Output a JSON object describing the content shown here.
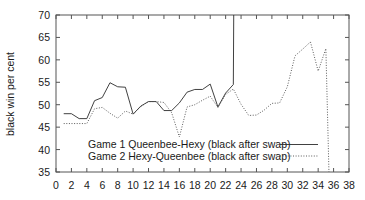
{
  "chart_data": {
    "type": "line",
    "title": "",
    "xlabel": "",
    "ylabel": "black win per cent",
    "xlim": [
      0,
      38
    ],
    "ylim": [
      35,
      70
    ],
    "grid": false,
    "legend_position": "inside-bottom-center",
    "x_ticks": [
      0,
      2,
      4,
      6,
      8,
      10,
      12,
      14,
      16,
      18,
      20,
      22,
      24,
      26,
      28,
      30,
      32,
      34,
      36,
      38
    ],
    "y_ticks": [
      35,
      40,
      45,
      50,
      55,
      60,
      65,
      70
    ],
    "series": [
      {
        "name": "Game 1 Queenbee-Hexy (black after swap)",
        "style": "solid",
        "color": "#2b2b2b",
        "x": [
          1,
          2,
          3,
          4,
          5,
          6,
          7,
          8,
          9,
          10,
          11,
          12,
          13,
          14,
          15,
          16,
          17,
          18,
          19,
          20,
          21,
          22,
          23,
          23.05
        ],
        "values": [
          48.0,
          48.0,
          46.9,
          46.9,
          50.9,
          51.6,
          54.9,
          54.0,
          53.9,
          47.9,
          49.7,
          50.7,
          50.7,
          48.7,
          48.7,
          50.4,
          52.8,
          53.4,
          53.4,
          54.6,
          49.5,
          52.6,
          54.5,
          70.0
        ]
      },
      {
        "name": "Game 2 Hexy-Queenbee (black after swap)",
        "style": "dotted",
        "color": "#4a4a4a",
        "x": [
          1,
          2,
          3,
          4,
          5,
          6,
          7,
          8,
          9,
          10,
          11,
          12,
          13,
          14,
          15,
          16,
          17,
          18,
          19,
          20,
          21,
          22,
          23,
          24,
          25,
          26,
          27,
          28,
          29,
          30,
          31,
          32,
          33,
          34,
          35,
          35.4
        ],
        "values": [
          45.8,
          45.8,
          45.8,
          45.8,
          49.1,
          49.4,
          48.1,
          47.0,
          48.6,
          47.9,
          49.6,
          50.7,
          50.7,
          50.5,
          48.2,
          42.8,
          49.5,
          50.0,
          51.0,
          51.9,
          49.4,
          52.3,
          53.5,
          50.1,
          47.6,
          47.7,
          48.8,
          50.3,
          50.4,
          54.0,
          60.9,
          62.4,
          64.0,
          57.5,
          62.5,
          35.0
        ]
      }
    ]
  },
  "legend": {
    "entries": [
      {
        "label": "Game 1 Queenbee-Hexy (black after swap)",
        "style": "solid"
      },
      {
        "label": "Game 2 Hexy-Queenbee (black after swap)",
        "style": "dotted"
      }
    ]
  },
  "axis": {
    "y_label": "black win per cent",
    "y_tick_labels": [
      "70",
      "65",
      "60",
      "55",
      "50",
      "45",
      "40",
      "35"
    ],
    "x_tick_labels": [
      "0",
      "2",
      "4",
      "6",
      "8",
      "10",
      "12",
      "14",
      "16",
      "18",
      "20",
      "22",
      "24",
      "26",
      "28",
      "30",
      "32",
      "34",
      "36",
      "38"
    ]
  }
}
